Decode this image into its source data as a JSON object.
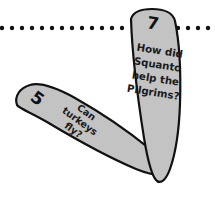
{
  "page": {
    "background_color": "#ffffff",
    "width": 215,
    "height": 201
  },
  "divider": {
    "name": "dotted-divider",
    "orientation": "horizontal",
    "y": 28,
    "dot_color": "#111111",
    "dot_radius": 2.2,
    "dot_spacing": 10,
    "dot_count": 22
  },
  "cards": [
    {
      "id": "card-can-turkeys-fly",
      "number": "5",
      "shape": "feather",
      "fill_color": "#c3c3c3",
      "outline_color": "#111111",
      "rotation_deg": 36,
      "lines": [
        "Can",
        "turkeys",
        "fly?"
      ],
      "full_text": "Can turkeys fly?"
    },
    {
      "id": "card-how-did-squanto",
      "number": "7",
      "shape": "feather",
      "fill_color": "#c3c3c3",
      "outline_color": "#111111",
      "rotation_deg": 9,
      "lines": [
        "How did",
        "Squanto",
        "help the",
        "Pilgrims?"
      ],
      "full_text": "How did Squanto help the Pilgrims?"
    }
  ]
}
